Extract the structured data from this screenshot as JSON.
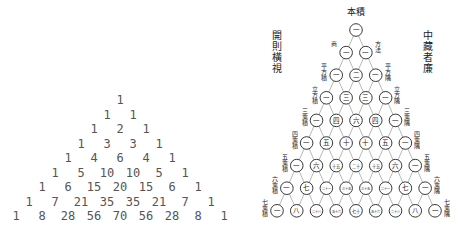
{
  "modern_triangle": {
    "rows": [
      [
        1
      ],
      [
        1,
        1
      ],
      [
        1,
        2,
        1
      ],
      [
        1,
        3,
        3,
        1
      ],
      [
        1,
        4,
        6,
        4,
        1
      ],
      [
        1,
        5,
        10,
        10,
        5,
        1
      ],
      [
        1,
        6,
        15,
        20,
        15,
        6,
        1
      ],
      [
        1,
        7,
        21,
        35,
        35,
        21,
        7,
        1
      ],
      [
        1,
        8,
        28,
        56,
        70,
        56,
        28,
        8,
        1
      ]
    ],
    "text_color": "#555555"
  },
  "historic_triangle": {
    "apex_label": "本積",
    "left_title": "開則橫視",
    "right_title": "中藏者廉",
    "left_edge_labels": [
      "商",
      "平方積",
      "立方積",
      "三乘積",
      "四乘積",
      "五乘積",
      "六乘積",
      "七乘積"
    ],
    "right_edge_labels": [
      "方法",
      "平方隅",
      "立方隅",
      "三乘隅",
      "四乘隅",
      "五乘隅",
      "六乘隅",
      "七乘隅"
    ],
    "rod_numerals_rows": [
      [
        "一"
      ],
      [
        "一",
        "一"
      ],
      [
        "一",
        "二",
        "一"
      ],
      [
        "一",
        "三",
        "三",
        "一"
      ],
      [
        "一",
        "四",
        "六",
        "四",
        "一"
      ],
      [
        "一",
        "五",
        "十",
        "十",
        "五",
        "一"
      ],
      [
        "一",
        "六",
        "十五",
        "二十",
        "十五",
        "六",
        "一"
      ],
      [
        "一",
        "七",
        "二十一",
        "三十五",
        "三十五",
        "二十一",
        "七",
        "一"
      ],
      [
        "一",
        "八",
        "二十八",
        "五十六",
        "七十",
        "五十六",
        "二十八",
        "八",
        "一"
      ]
    ],
    "ink_color": "#222222"
  }
}
